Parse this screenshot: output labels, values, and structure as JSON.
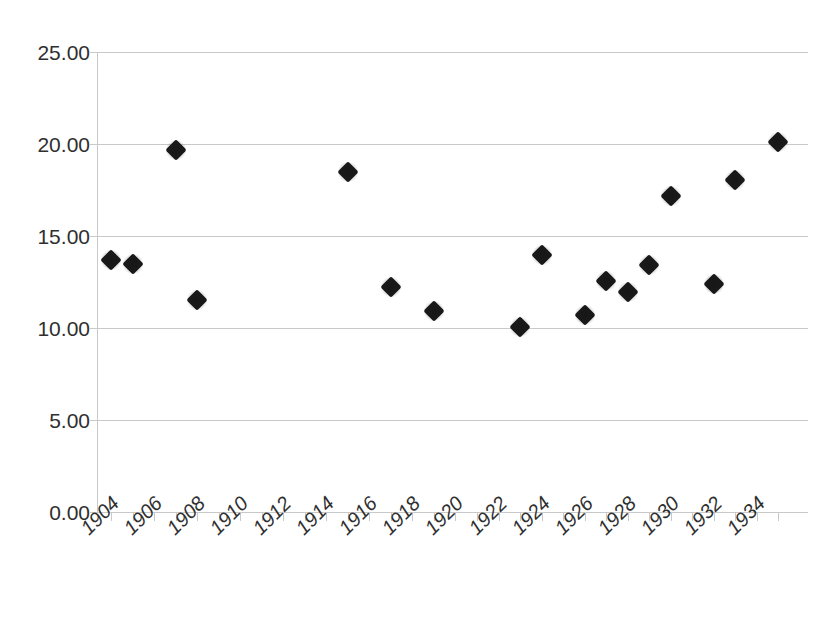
{
  "chart_data": {
    "type": "scatter",
    "title": "",
    "subtitle": "",
    "xlabel": "",
    "ylabel": "",
    "xlim": [
      1903,
      1935
    ],
    "ylim": [
      0,
      25
    ],
    "ytick_labels": [
      "25.00",
      "20.00",
      "15.00",
      "10.00",
      "5.00",
      "0.00"
    ],
    "ytick_values": [
      25,
      20,
      15,
      10,
      5,
      0
    ],
    "xtick_labels": [
      "1904",
      "1906",
      "1908",
      "1910",
      "1912",
      "1914",
      "1916",
      "1918",
      "1920",
      "1922",
      "1924",
      "1926",
      "1928",
      "1930",
      "1932",
      "1934"
    ],
    "xtick_values": [
      1904,
      1906,
      1908,
      1910,
      1912,
      1914,
      1916,
      1918,
      1920,
      1922,
      1924,
      1926,
      1928,
      1930,
      1932,
      1934
    ],
    "xtick_minor_values": [
      1905,
      1907,
      1909,
      1911,
      1913,
      1915,
      1917,
      1919,
      1921,
      1923,
      1925,
      1927,
      1929,
      1931,
      1933,
      1935
    ],
    "grid": "horizontal",
    "legend": "none",
    "marker_style": "filled-diamond",
    "marker_color": "#1a1a1a",
    "gridline_color": "#c9c9c9",
    "background_color": "#ffffff",
    "text_color": "#2f2f2f",
    "x": [
      1904,
      1905,
      1907,
      1908,
      1915,
      1917,
      1919,
      1923,
      1924,
      1926,
      1927,
      1928,
      1929,
      1930,
      1932,
      1933,
      1935
    ],
    "y": [
      13.7,
      13.5,
      19.7,
      11.5,
      18.5,
      12.25,
      10.9,
      10.05,
      13.95,
      10.7,
      12.55,
      11.95,
      13.4,
      17.15,
      12.4,
      18.05,
      20.1
    ],
    "points": [
      {
        "x": 1904,
        "y": 13.7
      },
      {
        "x": 1905,
        "y": 13.5
      },
      {
        "x": 1907,
        "y": 19.7
      },
      {
        "x": 1908,
        "y": 11.5
      },
      {
        "x": 1915,
        "y": 18.5
      },
      {
        "x": 1917,
        "y": 12.25
      },
      {
        "x": 1919,
        "y": 10.9
      },
      {
        "x": 1923,
        "y": 10.05
      },
      {
        "x": 1924,
        "y": 13.95
      },
      {
        "x": 1926,
        "y": 10.7
      },
      {
        "x": 1927,
        "y": 12.55
      },
      {
        "x": 1928,
        "y": 11.95
      },
      {
        "x": 1929,
        "y": 13.4
      },
      {
        "x": 1930,
        "y": 17.15
      },
      {
        "x": 1932,
        "y": 12.4
      },
      {
        "x": 1933,
        "y": 18.05
      },
      {
        "x": 1935,
        "y": 20.1
      }
    ]
  }
}
